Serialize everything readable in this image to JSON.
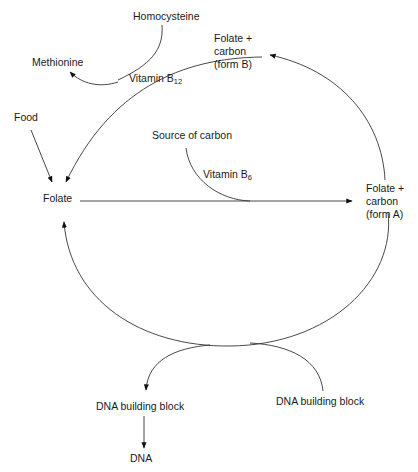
{
  "diagram": {
    "colors": {
      "line": "#333333",
      "text": "#1a1a1a",
      "background": "#ffffff"
    },
    "nodes": {
      "homocysteine": "Homocysteine",
      "methionine": "Methionine",
      "vitamin_b12": {
        "base": "Vitamin B",
        "sub": "12"
      },
      "folate_carbon_b": [
        "Folate +",
        "carbon",
        "(form B)"
      ],
      "food": "Food",
      "source_of_carbon": "Source of carbon",
      "vitamin_b6": {
        "base": "Vitamin B",
        "sub": "6"
      },
      "folate": "Folate",
      "folate_carbon_a": [
        "Folate +",
        "carbon",
        "(form A)"
      ],
      "dna_building_block_left": "DNA building block",
      "dna_building_block_right": "DNA building block",
      "dna": "DNA"
    },
    "edges": [
      {
        "from": "folate",
        "to": "folate_carbon_a",
        "via": "vitamin_b6",
        "input": "source_of_carbon"
      },
      {
        "from": "folate_carbon_a",
        "to": "folate_carbon_b"
      },
      {
        "from": "folate_carbon_b",
        "to": "folate",
        "via": "vitamin_b12",
        "input": "homocysteine",
        "output": "methionine"
      },
      {
        "from": "food",
        "to": "folate"
      },
      {
        "from": "folate_carbon_a",
        "to": "folate",
        "input": "dna_building_block_right",
        "output": "dna_building_block_left"
      },
      {
        "from": "dna_building_block_left",
        "to": "dna"
      }
    ]
  }
}
